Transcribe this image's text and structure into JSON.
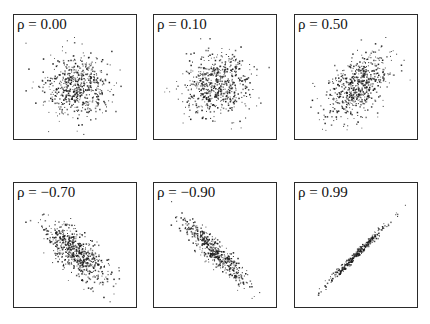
{
  "chart_data": [
    {
      "type": "scatter",
      "title": "ρ = 0.00",
      "rho": 0.0,
      "label": "ρ = 0.00",
      "n": 600,
      "xlim": [
        -3.5,
        3.5
      ],
      "ylim": [
        -3.5,
        3.5
      ],
      "grid": false,
      "axes_ticks": false
    },
    {
      "type": "scatter",
      "title": "ρ = 0.10",
      "rho": 0.1,
      "label": "ρ = 0.10",
      "n": 600,
      "xlim": [
        -3.5,
        3.5
      ],
      "ylim": [
        -3.5,
        3.5
      ],
      "grid": false,
      "axes_ticks": false
    },
    {
      "type": "scatter",
      "title": "ρ = 0.50",
      "rho": 0.5,
      "label": "ρ = 0.50",
      "n": 600,
      "xlim": [
        -3.5,
        3.5
      ],
      "ylim": [
        -3.5,
        3.5
      ],
      "grid": false,
      "axes_ticks": false
    },
    {
      "type": "scatter",
      "title": "ρ = −0.70",
      "rho": -0.7,
      "label": "ρ = −0.70",
      "n": 600,
      "xlim": [
        -3.5,
        3.5
      ],
      "ylim": [
        -3.5,
        3.5
      ],
      "grid": false,
      "axes_ticks": false
    },
    {
      "type": "scatter",
      "title": "ρ = −0.90",
      "rho": -0.9,
      "label": "ρ = −0.90",
      "n": 500,
      "xlim": [
        -3.5,
        3.5
      ],
      "ylim": [
        -3.5,
        3.5
      ],
      "grid": false,
      "axes_ticks": false
    },
    {
      "type": "scatter",
      "title": "ρ = 0.99",
      "rho": 0.99,
      "label": "ρ = 0.99",
      "n": 300,
      "xlim": [
        -3.5,
        3.5
      ],
      "ylim": [
        -3.5,
        3.5
      ],
      "grid": false,
      "axes_ticks": false
    }
  ],
  "panels": [
    {
      "label": "ρ = 0.00"
    },
    {
      "label": "ρ = 0.10"
    },
    {
      "label": "ρ = 0.50"
    },
    {
      "label": "ρ = −0.70"
    },
    {
      "label": "ρ = −0.90"
    },
    {
      "label": "ρ = 0.99"
    }
  ],
  "colors": {
    "points": "#1a1a1a",
    "frame": "#2a2a2a",
    "background": "#ffffff"
  }
}
